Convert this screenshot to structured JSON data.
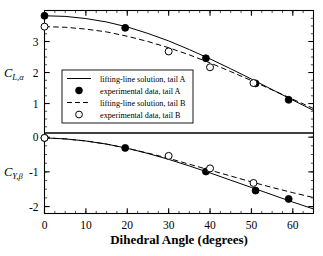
{
  "chart_data": {
    "type": "line",
    "title": "",
    "xlabel": "Dihedral Angle (degrees)",
    "xlim": [
      0,
      65
    ],
    "xticks": [
      0,
      10,
      20,
      30,
      40,
      50,
      60
    ],
    "xticklabels": [
      "0",
      "10",
      "20",
      "30",
      "40",
      "50",
      "60"
    ],
    "grid": false,
    "legend_position": "center-left",
    "panels": [
      {
        "name": "upper-panel",
        "ylabel": "C_{L,alpha}",
        "ylabel_base": "C",
        "ylabel_sub": "L,α",
        "ylim": [
          0.05,
          4.0
        ],
        "yticks": [
          1,
          2,
          3
        ],
        "yticklabels": [
          "1",
          "2",
          "3"
        ],
        "series": [
          {
            "name": "lifting-line solution, tail A",
            "style": "solid-line",
            "x": [
              0,
              5,
              10,
              15,
              20,
              25,
              30,
              35,
              40,
              45,
              50,
              55,
              60,
              65
            ],
            "y": [
              3.83,
              3.81,
              3.74,
              3.63,
              3.47,
              3.26,
              3.02,
              2.74,
              2.44,
              2.12,
              1.79,
              1.45,
              1.11,
              0.78
            ]
          },
          {
            "name": "experimental data, tail A",
            "style": "filled-circle",
            "x": [
              0,
              19.5,
              39,
              51,
              59
            ],
            "y": [
              3.83,
              3.44,
              2.46,
              1.65,
              1.12
            ]
          },
          {
            "name": "lifting-line solution, tail B",
            "style": "dashed-line",
            "x": [
              0,
              5,
              10,
              15,
              20,
              25,
              30,
              35,
              40,
              45,
              50,
              55,
              60,
              65
            ],
            "y": [
              3.48,
              3.46,
              3.4,
              3.31,
              3.17,
              3.0,
              2.8,
              2.57,
              2.31,
              2.03,
              1.74,
              1.44,
              1.14,
              0.84
            ]
          },
          {
            "name": "experimental data, tail B",
            "style": "open-circle",
            "x": [
              0,
              30,
              40,
              50.5
            ],
            "y": [
              3.48,
              2.68,
              2.17,
              1.66
            ]
          }
        ]
      },
      {
        "name": "lower-panel",
        "ylabel": "C_{Y,beta}",
        "ylabel_base": "C",
        "ylabel_sub": "Y,β",
        "ylim": [
          -2.2,
          0.12
        ],
        "yticks": [
          0,
          -1,
          -2
        ],
        "yticklabels": [
          "0",
          "-1",
          "-2"
        ],
        "series": [
          {
            "name": "lifting-line solution, tail A",
            "style": "solid-line",
            "x": [
              0,
              5,
              10,
              15,
              20,
              25,
              30,
              35,
              40,
              45,
              50,
              55,
              60,
              65
            ],
            "y": [
              -0.02,
              -0.05,
              -0.11,
              -0.2,
              -0.32,
              -0.47,
              -0.64,
              -0.83,
              -1.03,
              -1.24,
              -1.45,
              -1.66,
              -1.87,
              -2.07
            ]
          },
          {
            "name": "experimental data, tail A",
            "style": "filled-circle",
            "x": [
              0,
              19.5,
              39,
              51,
              59
            ],
            "y": [
              -0.02,
              -0.31,
              -0.99,
              -1.54,
              -1.78
            ]
          },
          {
            "name": "lifting-line solution, tail B",
            "style": "dashed-line",
            "x": [
              0,
              5,
              10,
              15,
              20,
              25,
              30,
              35,
              40,
              45,
              50,
              55,
              60,
              65
            ],
            "y": [
              -0.02,
              -0.05,
              -0.11,
              -0.2,
              -0.32,
              -0.46,
              -0.61,
              -0.78,
              -0.95,
              -1.12,
              -1.29,
              -1.45,
              -1.6,
              -1.74
            ]
          },
          {
            "name": "experimental data, tail B",
            "style": "open-circle",
            "x": [
              0,
              30,
              40,
              50.5
            ],
            "y": [
              -0.02,
              -0.54,
              -0.9,
              -1.32
            ]
          }
        ]
      }
    ],
    "legend": [
      {
        "label": "lifting-line solution, tail A",
        "marker": "solid-line"
      },
      {
        "label": "experimental data, tail A",
        "marker": "filled-circle"
      },
      {
        "label": "lifting-line solution, tail B",
        "marker": "dashed-line"
      },
      {
        "label": "experimental data, tail B",
        "marker": "open-circle"
      }
    ]
  }
}
